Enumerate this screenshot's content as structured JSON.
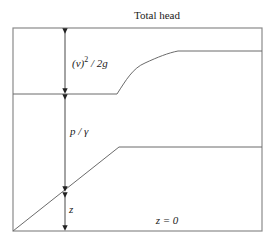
{
  "diagram": {
    "title": "Total head",
    "labels": {
      "velocity_head_base": "(v)",
      "velocity_head_exp": "2",
      "velocity_head_rest": " / 2g",
      "pressure_head": "p / γ",
      "elevation_head": "z",
      "datum": "z = 0"
    },
    "components": [
      {
        "name": "velocity head",
        "label": "(v)^2 / 2g"
      },
      {
        "name": "pressure head",
        "label": "p / γ"
      },
      {
        "name": "elevation head",
        "label": "z"
      }
    ],
    "colors": {
      "lines": "#6b6b6b",
      "frame": "#8a8a8a",
      "text": "#222222"
    }
  }
}
